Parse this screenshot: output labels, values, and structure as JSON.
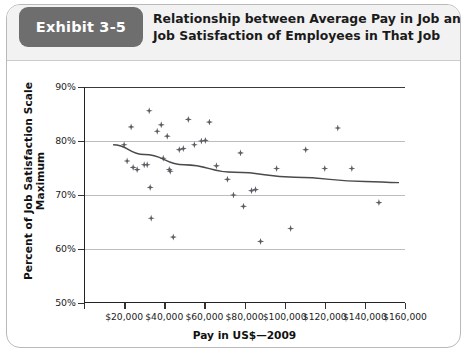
{
  "exhibit": {
    "badge_label": "Exhibit 3-5",
    "title_line1": "Relationship between Average Pay in Job and",
    "title_line2": "Job Satisfaction of Employees in That Job",
    "badge_color": "#6e6e6e",
    "header_bg": "#f2f2f2"
  },
  "chart_data": {
    "type": "scatter",
    "title": "Relationship between Average Pay in Job and Job Satisfaction of Employees in That Job",
    "xlabel": "Pay in US$—2009",
    "ylabel": "Percent of Job Satisfaction Scale Maximum",
    "xlim": [
      0,
      160000
    ],
    "ylim": [
      50,
      90
    ],
    "xticks": [
      0,
      20000,
      40000,
      60000,
      80000,
      100000,
      120000,
      140000,
      160000
    ],
    "xticklabels": [
      "",
      "$20,000",
      "$40,000",
      "$60,000",
      "$80,000",
      "$100,000",
      "$120,000",
      "$140,000",
      "$160,000"
    ],
    "yticks": [
      50,
      60,
      70,
      80,
      90
    ],
    "yticklabels": [
      "50%",
      "60%",
      "70%",
      "80%",
      "90%"
    ],
    "grid": "horizontal",
    "legend": "none",
    "marker": "diamond",
    "marker_color": "#5d5d65",
    "points": [
      {
        "x": 20000,
        "y": 79.3
      },
      {
        "x": 21500,
        "y": 76.3
      },
      {
        "x": 23500,
        "y": 82.6
      },
      {
        "x": 24500,
        "y": 75.1
      },
      {
        "x": 26500,
        "y": 74.7
      },
      {
        "x": 30000,
        "y": 75.6
      },
      {
        "x": 31500,
        "y": 75.6
      },
      {
        "x": 32500,
        "y": 85.6
      },
      {
        "x": 33000,
        "y": 71.4
      },
      {
        "x": 33500,
        "y": 65.7
      },
      {
        "x": 36500,
        "y": 81.8
      },
      {
        "x": 38500,
        "y": 83.0
      },
      {
        "x": 39500,
        "y": 76.8
      },
      {
        "x": 41500,
        "y": 80.9
      },
      {
        "x": 42500,
        "y": 74.7
      },
      {
        "x": 43000,
        "y": 74.4
      },
      {
        "x": 44500,
        "y": 62.2
      },
      {
        "x": 47500,
        "y": 78.4
      },
      {
        "x": 49500,
        "y": 78.6
      },
      {
        "x": 52000,
        "y": 84.0
      },
      {
        "x": 55000,
        "y": 79.3
      },
      {
        "x": 58500,
        "y": 80.0
      },
      {
        "x": 60500,
        "y": 80.1
      },
      {
        "x": 62500,
        "y": 83.5
      },
      {
        "x": 66000,
        "y": 75.4
      },
      {
        "x": 71500,
        "y": 72.9
      },
      {
        "x": 74500,
        "y": 70.0
      },
      {
        "x": 78000,
        "y": 77.8
      },
      {
        "x": 79500,
        "y": 67.9
      },
      {
        "x": 83500,
        "y": 70.8
      },
      {
        "x": 85500,
        "y": 71.0
      },
      {
        "x": 88000,
        "y": 61.4
      },
      {
        "x": 96000,
        "y": 74.9
      },
      {
        "x": 103000,
        "y": 63.8
      },
      {
        "x": 110500,
        "y": 78.4
      },
      {
        "x": 120000,
        "y": 74.9
      },
      {
        "x": 126500,
        "y": 82.4
      },
      {
        "x": 133500,
        "y": 74.9
      },
      {
        "x": 147000,
        "y": 68.6
      }
    ],
    "trendline": {
      "description": "fitted curve, slightly decreasing",
      "points": [
        {
          "x": 14500,
          "y": 79.3
        },
        {
          "x": 30000,
          "y": 77.5
        },
        {
          "x": 50000,
          "y": 75.6
        },
        {
          "x": 75000,
          "y": 74.2
        },
        {
          "x": 105000,
          "y": 73.3
        },
        {
          "x": 140000,
          "y": 72.5
        },
        {
          "x": 157000,
          "y": 72.3
        }
      ],
      "color": "#4a4a4a"
    }
  }
}
